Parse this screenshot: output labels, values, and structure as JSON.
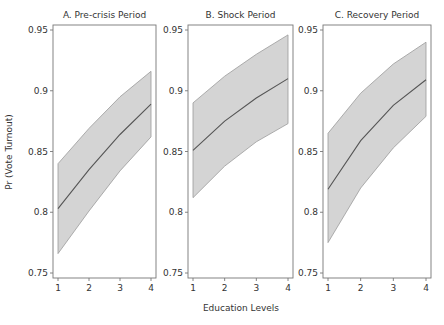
{
  "chart_data": {
    "type": "line",
    "subtype": "line-with-confidence-band",
    "ylabel": "Pr (Vote Turnout)",
    "xlabel": "Education Levels",
    "ylim": [
      0.75,
      0.95
    ],
    "yticks": [
      0.75,
      0.8,
      0.85,
      0.9,
      0.95
    ],
    "ytick_labels": [
      "0.75",
      "0.8",
      "0.85",
      "0.9",
      "0.95"
    ],
    "xticks": [
      1,
      2,
      3,
      4
    ],
    "xtick_labels": [
      "1",
      "2",
      "3",
      "4"
    ],
    "grid": false,
    "legend": null,
    "colors": {
      "band_fill": "#d4d4d4",
      "band_edge": "#9a9a9a",
      "line": "#555555",
      "frame": "#777777"
    },
    "panels": [
      {
        "title": "A. Pre-crisis Period",
        "x": [
          1,
          2,
          3,
          4
        ],
        "series": [
          {
            "name": "upper",
            "values": [
              0.84,
              0.869,
              0.895,
              0.916
            ]
          },
          {
            "name": "predicted",
            "values": [
              0.803,
              0.835,
              0.864,
              0.889
            ]
          },
          {
            "name": "lower",
            "values": [
              0.766,
              0.801,
              0.834,
              0.862
            ]
          }
        ]
      },
      {
        "title": "B. Shock Period",
        "x": [
          1,
          2,
          3,
          4
        ],
        "series": [
          {
            "name": "upper",
            "values": [
              0.89,
              0.912,
              0.93,
              0.946
            ]
          },
          {
            "name": "predicted",
            "values": [
              0.851,
              0.875,
              0.894,
              0.91
            ]
          },
          {
            "name": "lower",
            "values": [
              0.812,
              0.838,
              0.858,
              0.873
            ]
          }
        ]
      },
      {
        "title": "C. Recovery Period",
        "x": [
          1,
          2,
          3,
          4
        ],
        "series": [
          {
            "name": "upper",
            "values": [
              0.865,
              0.898,
              0.922,
              0.94
            ]
          },
          {
            "name": "predicted",
            "values": [
              0.819,
              0.859,
              0.888,
              0.909
            ]
          },
          {
            "name": "lower",
            "values": [
              0.775,
              0.82,
              0.853,
              0.879
            ]
          }
        ]
      }
    ]
  }
}
